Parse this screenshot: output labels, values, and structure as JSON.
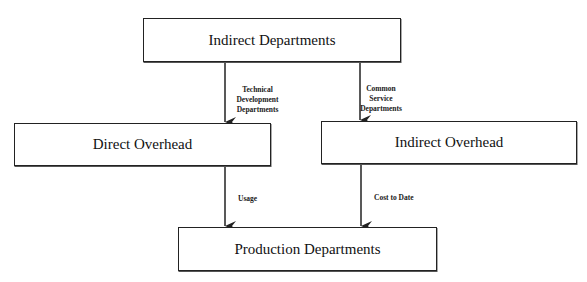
{
  "diagram": {
    "nodes": {
      "indirect_departments": "Indirect Departments",
      "direct_overhead": "Direct Overhead",
      "indirect_overhead": "Indirect Overhead",
      "production_departments": "Production Departments"
    },
    "edges": [
      {
        "from": "Indirect Departments",
        "to": "Direct Overhead",
        "label_lines": [
          "Technical",
          "Development",
          "Departments"
        ]
      },
      {
        "from": "Indirect Departments",
        "to": "Indirect Overhead",
        "label_lines": [
          "Common",
          "Service",
          "Departments"
        ]
      },
      {
        "from": "Direct Overhead",
        "to": "Production Departments",
        "label": "Usage"
      },
      {
        "from": "Indirect Overhead",
        "to": "Production Departments",
        "label": "Cost to Date"
      }
    ],
    "colors": {
      "stroke": "#222222",
      "background": "#ffffff",
      "text": "#111111"
    }
  }
}
